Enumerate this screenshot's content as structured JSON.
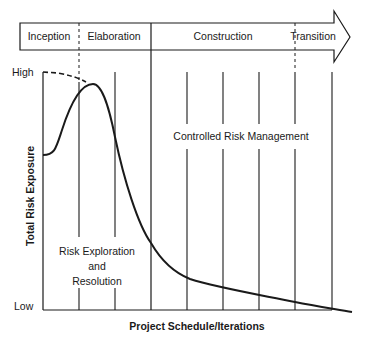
{
  "phases": [
    {
      "label": "Inception"
    },
    {
      "label": "Elaboration"
    },
    {
      "label": "Construction"
    },
    {
      "label": "Transition"
    }
  ],
  "axes": {
    "y_label": "Total Risk Exposure",
    "y_high": "High",
    "y_low": "Low",
    "x_label": "Project Schedule/Iterations"
  },
  "regions": {
    "exploration": [
      "Risk Exploration",
      "and",
      "Resolution"
    ],
    "controlled": "Controlled Risk Management"
  },
  "colors": {
    "line": "#1a1a1a",
    "background": "#ffffff"
  }
}
